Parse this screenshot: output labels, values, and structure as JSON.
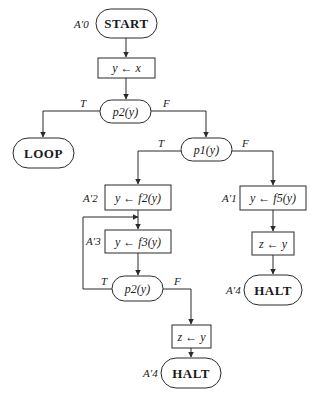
{
  "diagram": {
    "type": "flowchart",
    "nodes": {
      "start": {
        "label": "START",
        "tag": "A′0",
        "shape": "terminal"
      },
      "assign_init": {
        "label": "y ← x",
        "shape": "process"
      },
      "test_p2_top": {
        "label": "p2(y)",
        "shape": "decision",
        "true_label": "T",
        "false_label": "F"
      },
      "loop": {
        "label": "LOOP",
        "shape": "terminal"
      },
      "test_p1": {
        "label": "p1(y)",
        "shape": "decision",
        "true_label": "T",
        "false_label": "F"
      },
      "assign_f2": {
        "label": "y ← f2(y)",
        "tag": "A′2",
        "shape": "process"
      },
      "assign_f5": {
        "label": "y ← f5(y)",
        "tag": "A′1",
        "shape": "process"
      },
      "assign_f3": {
        "label": "y ← f3(y)",
        "tag": "A′3",
        "shape": "process"
      },
      "test_p2_bottom": {
        "label": "p2(y)",
        "shape": "decision",
        "true_label": "T",
        "false_label": "F"
      },
      "assign_z_right": {
        "label": "z ← y",
        "shape": "process"
      },
      "halt_right": {
        "label": "HALT",
        "tag": "A′4",
        "shape": "terminal"
      },
      "assign_z_bottom": {
        "label": "z ← y",
        "shape": "process"
      },
      "halt_bottom": {
        "label": "HALT",
        "tag": "A′4",
        "shape": "terminal"
      }
    },
    "edges": [
      {
        "from": "start",
        "to": "assign_init"
      },
      {
        "from": "assign_init",
        "to": "test_p2_top"
      },
      {
        "from": "test_p2_top",
        "to": "loop",
        "label": "T"
      },
      {
        "from": "test_p2_top",
        "to": "test_p1",
        "label": "F"
      },
      {
        "from": "test_p1",
        "to": "assign_f2",
        "label": "T"
      },
      {
        "from": "test_p1",
        "to": "assign_f5",
        "label": "F"
      },
      {
        "from": "assign_f2",
        "to": "assign_f3"
      },
      {
        "from": "assign_f3",
        "to": "test_p2_bottom"
      },
      {
        "from": "test_p2_bottom",
        "to": "assign_f3",
        "label": "T"
      },
      {
        "from": "test_p2_bottom",
        "to": "assign_z_bottom",
        "label": "F"
      },
      {
        "from": "assign_z_bottom",
        "to": "halt_bottom"
      },
      {
        "from": "assign_f5",
        "to": "assign_z_right"
      },
      {
        "from": "assign_z_right",
        "to": "halt_right"
      }
    ]
  }
}
